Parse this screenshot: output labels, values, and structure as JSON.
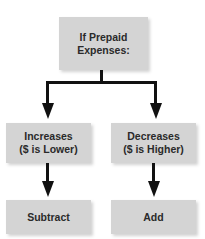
{
  "diagram": {
    "root": {
      "line1": "If Prepaid",
      "line2": "Expenses:"
    },
    "branches": [
      {
        "line1": "Increases",
        "line2": "($ is Lower)",
        "result": "Subtract"
      },
      {
        "line1": "Decreases",
        "line2": "($ is Higher)",
        "result": "Add"
      }
    ],
    "colors": {
      "box": "#d4d4d4",
      "line": "#111111",
      "text": "#2a2a2a"
    }
  }
}
